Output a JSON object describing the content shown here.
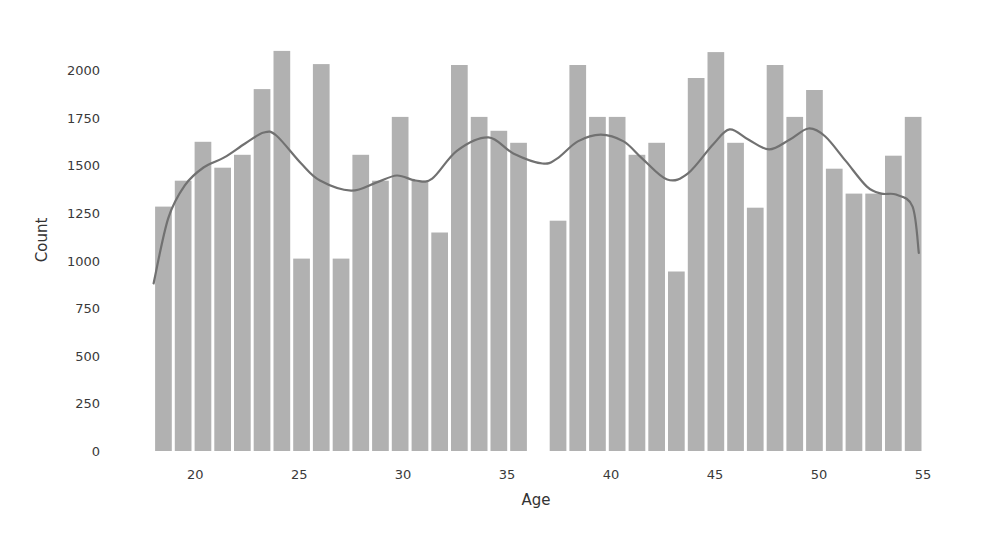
{
  "chart_data": {
    "type": "bar",
    "subtype": "histogram_with_kde",
    "title": "",
    "xlabel": "Age",
    "ylabel": "Count",
    "xlim": [
      18,
      55
    ],
    "ylim": [
      0,
      2100
    ],
    "x_ticks": [
      20,
      25,
      30,
      35,
      40,
      45,
      50,
      55
    ],
    "y_ticks": [
      0,
      250,
      500,
      750,
      1000,
      1250,
      1500,
      1750,
      2000
    ],
    "grid": false,
    "legend": null,
    "bin_count": 39,
    "bin_start": 18,
    "bin_end": 55,
    "values": [
      1283,
      1419,
      1623,
      1487,
      1555,
      1900,
      2100,
      1010,
      2031,
      1010,
      1555,
      1419,
      1754,
      1419,
      1147,
      2026,
      1754,
      1681,
      1618,
      0,
      1209,
      2026,
      1754,
      1754,
      1555,
      1618,
      942,
      1958,
      2094,
      1618,
      1277,
      2026,
      1754,
      1895,
      1482,
      1351,
      1351,
      1550,
      1754
    ],
    "kde": {
      "x": [
        18.0,
        18.7,
        19.5,
        20.4,
        21.4,
        22.4,
        23.3,
        23.9,
        25.1,
        26.0,
        27.5,
        28.7,
        29.7,
        30.6,
        31.4,
        32.6,
        34.1,
        35.3,
        36.7,
        37.4,
        38.4,
        39.5,
        40.6,
        41.5,
        42.7,
        43.7,
        44.9,
        45.7,
        46.6,
        47.6,
        48.6,
        49.5,
        50.3,
        51.3,
        52.3,
        53.0,
        53.7,
        54.5,
        54.8
      ],
      "y": [
        880,
        1221,
        1394,
        1488,
        1541,
        1614,
        1672,
        1656,
        1509,
        1420,
        1367,
        1409,
        1446,
        1420,
        1430,
        1577,
        1646,
        1562,
        1509,
        1535,
        1625,
        1661,
        1625,
        1535,
        1425,
        1457,
        1609,
        1688,
        1635,
        1583,
        1635,
        1693,
        1651,
        1520,
        1388,
        1351,
        1346,
        1283,
        1040
      ]
    },
    "colors": {
      "bars": "#b1b1b1",
      "kde_line": "#717171",
      "text": "#333333",
      "background": "#ffffff"
    }
  }
}
